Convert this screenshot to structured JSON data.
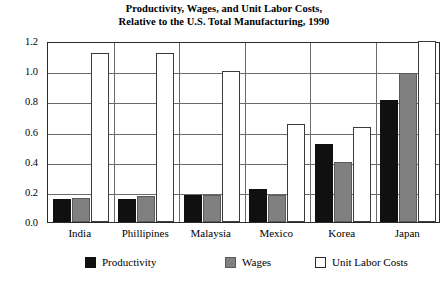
{
  "chart_data": {
    "type": "bar",
    "title": "Productivity, Wages, and Unit Labor Costs, Relative to the U.S. Total Manufacturing, 1990",
    "title_lines": [
      "Productivity, Wages, and Unit Labor Costs,",
      "Relative to the U.S. Total Manufacturing, 1990"
    ],
    "xlabel": "",
    "ylabel": "",
    "ylim": [
      0.0,
      1.2
    ],
    "ytick_labels": [
      "1.2",
      "1.0",
      "0.8",
      "0.6",
      "0.4",
      "0.2",
      "0.0"
    ],
    "ytick_values": [
      1.2,
      1.0,
      0.8,
      0.6,
      0.4,
      0.2,
      0.0
    ],
    "grid": true,
    "legend_position": "bottom",
    "categories": [
      "India",
      "Phillipines",
      "Malaysia",
      "Mexico",
      "Korea",
      "Japan"
    ],
    "series": [
      {
        "name": "Productivity",
        "color": "#101010",
        "values": [
          0.15,
          0.15,
          0.18,
          0.22,
          0.52,
          0.81
        ]
      },
      {
        "name": "Wages",
        "color": "#808080",
        "values": [
          0.16,
          0.17,
          0.18,
          0.18,
          0.4,
          0.99
        ]
      },
      {
        "name": "Unit Labor Costs",
        "color": "#ffffff",
        "values": [
          1.12,
          1.12,
          1.0,
          0.65,
          0.63,
          1.22
        ]
      }
    ]
  }
}
